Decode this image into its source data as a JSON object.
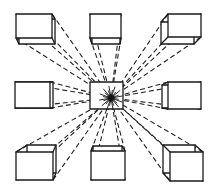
{
  "diagram": {
    "colors": {
      "ink": "#1a1a1a",
      "background": "#ffffff"
    },
    "vanishing_point": {
      "x": 111,
      "y": 98
    },
    "center_square": {
      "x1": 90,
      "y1": 82,
      "x2": 123,
      "y2": 109
    },
    "boxes": [
      {
        "id": "top-left",
        "front": [
          16,
          14,
          52,
          38
        ],
        "back": [
          19,
          19,
          55,
          44
        ]
      },
      {
        "id": "top-center",
        "front": [
          90,
          14,
          121,
          38
        ],
        "back": [
          92,
          18,
          120,
          44
        ]
      },
      {
        "id": "top-right",
        "front": [
          168,
          14,
          201,
          37
        ],
        "back": [
          161,
          22,
          194,
          44
        ]
      },
      {
        "id": "middle-left",
        "front": [
          15,
          82,
          50,
          108
        ],
        "back": [
          19,
          82,
          53,
          108
        ]
      },
      {
        "id": "middle-right",
        "front": [
          168,
          82,
          201,
          109
        ],
        "back": [
          162,
          85,
          195,
          108
        ]
      },
      {
        "id": "bottom-left",
        "front": [
          16,
          152,
          53,
          180
        ],
        "back": [
          27,
          145,
          56,
          173
        ]
      },
      {
        "id": "bottom-center",
        "front": [
          91,
          151,
          125,
          180
        ],
        "back": [
          93,
          146,
          122,
          175
        ]
      },
      {
        "id": "bottom-right",
        "front": [
          170,
          152,
          203,
          181
        ],
        "back": [
          163,
          145,
          195,
          173
        ]
      }
    ]
  }
}
